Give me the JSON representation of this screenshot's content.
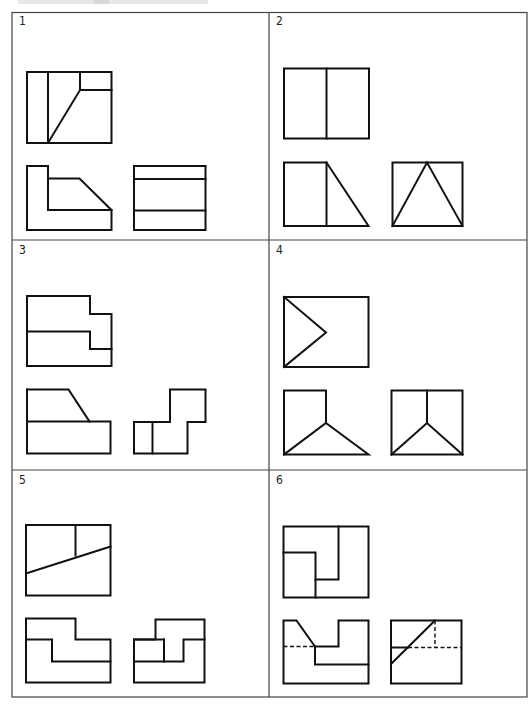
{
  "sheet": {
    "title": "Orthographic projection exercise sheet",
    "grid": {
      "rows": 3,
      "cols": 2
    },
    "colors": {
      "line": "#111111",
      "border": "#444444",
      "background": "#ffffff"
    }
  },
  "cells": [
    {
      "label": "1",
      "views": {
        "front": [
          "M27 72 H111.5 V143 H27 Z",
          "M48 72 V143",
          "M80 72 V90 H111.5",
          "M80 90 L48 143"
        ],
        "bottom_left": [
          "M27 166 H48 V210 H111.5 V230 H27 Z",
          "M48 178.5 H79.5 L111.5 210"
        ],
        "bottom_right": [
          "M134 166 H205.5 V230 H134 Z",
          "M134 179 H205.5",
          "M134 210.5 H205.5"
        ]
      }
    },
    {
      "label": "2",
      "views": {
        "front": [
          "M284 68.5 H369 V138.5 H284 Z",
          "M326.5 68.5 V138.5"
        ],
        "bottom_left": [
          "M284 162.5 H326.5 L368.5 226 H284 Z",
          "M326.5 162.5 V226"
        ],
        "bottom_right": [
          "M392.5 162.5 H462.5 V226 H392.5 Z",
          "M392.5 226 L427 162.5 L462.5 226"
        ]
      }
    },
    {
      "label": "3",
      "views": {
        "front": [
          "M27 296 H90 V314 H111.5 V366 H27 Z",
          "M27 331.5 H90 V349 H111.5"
        ],
        "bottom_left": [
          "M27 389.5 H68.5 L89.5 421.5",
          "M27 389.5 V453.5 H110.5 V421.5 H27"
        ],
        "bottom_right": [
          "M134 422 H170 V389.5 H205.5 V422 H187.5 V453.5 H134 Z",
          "M152.5 422 V453.5"
        ]
      }
    },
    {
      "label": "4",
      "views": {
        "front": [
          "M284 297 H368.5 V367 H284 Z",
          "M284 297 L326 332.5 L284 367"
        ],
        "bottom_left": [
          "M284 390.5 H326 V423 L368.5 454.5 H284 Z",
          "M326 423 L284 454.5"
        ],
        "bottom_right": [
          "M391.5 390.5 H462.5 V454.5 H391.5 Z",
          "M427 390.5 V423",
          "M391.5 454.5 L427 423 L462.5 454.5"
        ]
      }
    },
    {
      "label": "5",
      "views": {
        "front": [
          "M26 525 H110.5 V595.5 H26 Z",
          "M75.5 525 V555.5",
          "M26 573.5 L110.5 546.5"
        ],
        "bottom_left": [
          "M26 618.5 H75.5 V639.5 H110.5 V682.5 H26 Z",
          "M26 639.5 H52 V661.5 H110.5"
        ],
        "bottom_right": [
          "M134 639.5 H155.5 V619.5 H204.5 V682.5 H134 Z",
          "M204.5 639.5 H183.5 V661.5 H134",
          "M164 639.5 V661.5",
          "M134 639.5 H164"
        ]
      }
    },
    {
      "label": "6",
      "views": {
        "front": [
          "M283.5 526.5 H368.5 V597.5 H283.5 Z",
          "M283.5 552.5 H315.5 V597.5",
          "M338.5 526.5 V579.5 H315.5"
        ],
        "bottom_left": [
          "M283.5 620.5 H296.5 L315 646.5 H338.5 V620.5 H368.5 V683.5 H283.5 Z",
          "M315 646.5 V664.5 H368.5"
        ],
        "bottom_left_hidden": [
          "M283.5 646.5 H315"
        ],
        "bottom_right": [
          "M391 620.5 H461.5 V683.5 H391 Z",
          "M391 647.5 H408",
          "M391 664 L435 620.5"
        ],
        "bottom_right_hidden": [
          "M408 647.5 H461.5",
          "M435 620.5 V647.5"
        ]
      }
    }
  ]
}
